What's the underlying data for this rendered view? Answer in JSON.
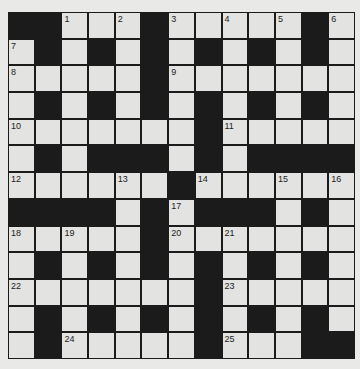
{
  "puzzle": {
    "rows": 13,
    "cols": 13,
    "layout": [
      "##W W W#W W W W W#W",
      "W#W#W#W#W#W#W",
      "WWWWW#WWWWWWW",
      "W#W#W#W#W#W#W",
      "WWWWWWW#WWWWW",
      "W#W###W#W####",
      "WWWWWW#WWWWWW",
      "####W#W###W#W",
      "WWWWW#WWWWWWW",
      "W#W#W#W#W#W#W",
      "WWWWWWW#WWWWW",
      "W#W#W#W#W#W#W",
      "W#WWWWW#WWW##"
    ],
    "grid": [
      [
        "#",
        "#",
        "W",
        "W",
        "W",
        "#",
        "W",
        "W",
        "W",
        "W",
        "W",
        "#",
        "W"
      ],
      [
        "W",
        "#",
        "W",
        "#",
        "W",
        "#",
        "W",
        "#",
        "W",
        "#",
        "W",
        "#",
        "W"
      ],
      [
        "W",
        "W",
        "W",
        "W",
        "W",
        "#",
        "W",
        "W",
        "W",
        "W",
        "W",
        "W",
        "W"
      ],
      [
        "W",
        "#",
        "W",
        "#",
        "W",
        "#",
        "W",
        "#",
        "W",
        "#",
        "W",
        "#",
        "W"
      ],
      [
        "W",
        "W",
        "W",
        "W",
        "W",
        "W",
        "W",
        "#",
        "W",
        "W",
        "W",
        "W",
        "W"
      ],
      [
        "W",
        "#",
        "W",
        "#",
        "#",
        "#",
        "W",
        "#",
        "W",
        "#",
        "#",
        "#",
        "#"
      ],
      [
        "W",
        "W",
        "W",
        "W",
        "W",
        "W",
        "#",
        "W",
        "W",
        "W",
        "W",
        "W",
        "W"
      ],
      [
        "#",
        "#",
        "#",
        "#",
        "W",
        "#",
        "W",
        "#",
        "#",
        "#",
        "W",
        "#",
        "W"
      ],
      [
        "W",
        "W",
        "W",
        "W",
        "W",
        "#",
        "W",
        "W",
        "W",
        "W",
        "W",
        "W",
        "W"
      ],
      [
        "W",
        "#",
        "W",
        "#",
        "W",
        "#",
        "W",
        "#",
        "W",
        "#",
        "W",
        "#",
        "W"
      ],
      [
        "W",
        "W",
        "W",
        "W",
        "W",
        "W",
        "W",
        "#",
        "W",
        "W",
        "W",
        "W",
        "W"
      ],
      [
        "W",
        "#",
        "W",
        "#",
        "W",
        "#",
        "W",
        "#",
        "W",
        "#",
        "W",
        "#",
        "W"
      ],
      [
        "W",
        "#",
        "W",
        "W",
        "W",
        "W",
        "W",
        "#",
        "W",
        "W",
        "W",
        "#",
        "#"
      ]
    ],
    "numbers": [
      {
        "row": 0,
        "col": 2,
        "label": "1"
      },
      {
        "row": 0,
        "col": 4,
        "label": "2"
      },
      {
        "row": 0,
        "col": 6,
        "label": "3"
      },
      {
        "row": 0,
        "col": 8,
        "label": "4"
      },
      {
        "row": 0,
        "col": 10,
        "label": "5"
      },
      {
        "row": 0,
        "col": 12,
        "label": "6"
      },
      {
        "row": 1,
        "col": 0,
        "label": "7"
      },
      {
        "row": 2,
        "col": 0,
        "label": "8"
      },
      {
        "row": 2,
        "col": 6,
        "label": "9"
      },
      {
        "row": 4,
        "col": 0,
        "label": "10"
      },
      {
        "row": 4,
        "col": 8,
        "label": "11"
      },
      {
        "row": 6,
        "col": 0,
        "label": "12"
      },
      {
        "row": 6,
        "col": 4,
        "label": "13"
      },
      {
        "row": 6,
        "col": 7,
        "label": "14"
      },
      {
        "row": 6,
        "col": 10,
        "label": "15"
      },
      {
        "row": 6,
        "col": 12,
        "label": "16"
      },
      {
        "row": 7,
        "col": 6,
        "label": "17"
      },
      {
        "row": 8,
        "col": 0,
        "label": "18"
      },
      {
        "row": 8,
        "col": 2,
        "label": "19"
      },
      {
        "row": 8,
        "col": 6,
        "label": "20"
      },
      {
        "row": 8,
        "col": 8,
        "label": "21"
      },
      {
        "row": 10,
        "col": 0,
        "label": "22"
      },
      {
        "row": 10,
        "col": 8,
        "label": "23"
      },
      {
        "row": 12,
        "col": 2,
        "label": "24"
      },
      {
        "row": 12,
        "col": 8,
        "label": "25"
      }
    ]
  },
  "colors": {
    "background": "#e9e9e7",
    "white_cell": "#e3e3e1",
    "black_cell": "#1b1b1b",
    "number_text": "#222222"
  }
}
